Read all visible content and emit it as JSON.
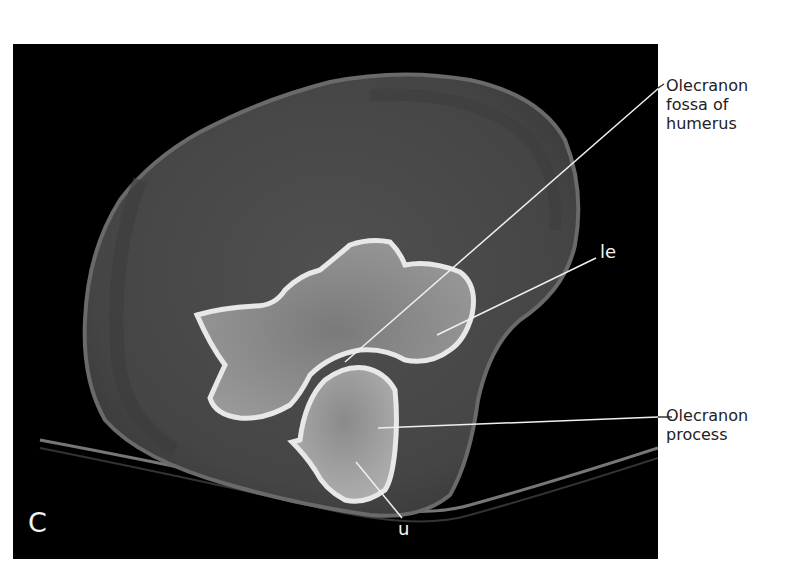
{
  "figure": {
    "panel_letter": "C",
    "image_type": "Axial CT scan of elbow",
    "background_color": "#000000",
    "soft_tissue_color": "#4a4a4a",
    "bone_color": "#d8d8d8"
  },
  "labels": {
    "olecranon_fossa": {
      "line1": "Olecranon",
      "line2": "fossa of",
      "line3": "humerus"
    },
    "le": "le",
    "olecranon_process": {
      "line1": "Olecranon",
      "line2": "process"
    },
    "u": "u"
  }
}
